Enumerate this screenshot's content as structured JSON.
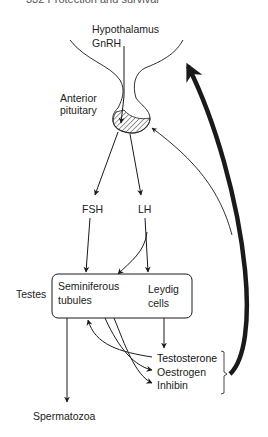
{
  "header": {
    "text": "332  Protection and survival"
  },
  "labels": {
    "hypothalamus": "Hypothalamus",
    "gnrh": "GnRH",
    "anterior_pituitary_line1": "Anterior",
    "anterior_pituitary_line2": "pituitary",
    "fsh": "FSH",
    "lh": "LH",
    "testes": "Testes",
    "seminiferous_line1": "Seminiferous",
    "seminiferous_line2": "tubules",
    "leydig_line1": "Leydig",
    "leydig_line2": "cells",
    "testosterone": "Testosterone",
    "oestrogen": "Oestrogen",
    "inhibin": "Inhibin",
    "spermatozoa": "Spermatozoa"
  },
  "colors": {
    "line": "#1a1a1a",
    "text": "#222222",
    "background": "#ffffff"
  }
}
